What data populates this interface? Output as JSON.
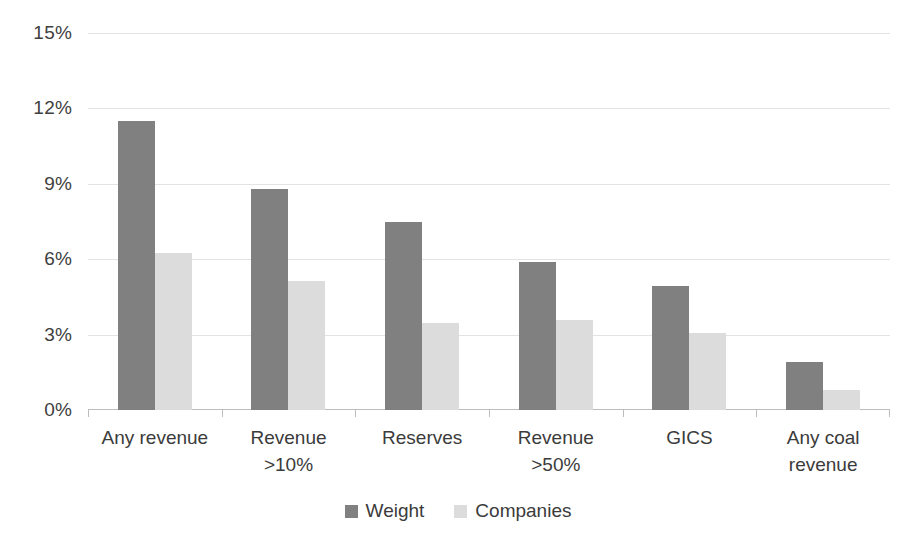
{
  "chart_data": {
    "type": "bar",
    "title": "",
    "subtitle": "",
    "xlabel": "",
    "ylabel": "",
    "ylim": [
      0,
      15
    ],
    "ytick_values": [
      15,
      12,
      9,
      6,
      3,
      0
    ],
    "ytick_labels": [
      "15%",
      "12%",
      "9%",
      "6%",
      "3%",
      "0%"
    ],
    "grid": true,
    "legend_position": "bottom",
    "categories": [
      "Any revenue",
      "Revenue\n>10%",
      "Reserves",
      "Revenue\n>50%",
      "GICS",
      "Any coal\nrevenue"
    ],
    "series": [
      {
        "name": "Weight",
        "color": "#808080",
        "values": [
          11.5,
          8.8,
          7.5,
          5.9,
          4.95,
          1.9
        ]
      },
      {
        "name": "Companies",
        "color": "#dcdcdc",
        "values": [
          6.25,
          5.15,
          3.45,
          3.6,
          3.05,
          0.8
        ]
      }
    ]
  },
  "legend": {
    "items": [
      {
        "label": "Weight",
        "swatch": "weight-swatch-icon"
      },
      {
        "label": "Companies",
        "swatch": "companies-swatch-icon"
      }
    ]
  },
  "colors": {
    "weight": "#808080",
    "companies": "#dcdcdc",
    "gridline": "#e3e3e3",
    "axis": "#bdbdbd",
    "text": "#3b3b3b",
    "background": "#ffffff"
  }
}
